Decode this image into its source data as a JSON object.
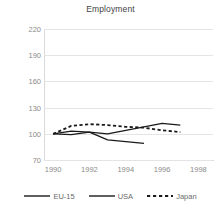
{
  "chart_data": {
    "type": "line",
    "title": "Employment",
    "xlabel": "",
    "ylabel": "",
    "x": [
      1990,
      1991,
      1992,
      1993,
      1994,
      1995,
      1996,
      1997
    ],
    "xlim": [
      1989.5,
      1998.8
    ],
    "ylim": [
      70,
      220
    ],
    "yticks": [
      70,
      100,
      130,
      160,
      190,
      220
    ],
    "xticks": [
      1990,
      1992,
      1994,
      1996,
      1998
    ],
    "grid": true,
    "legend_position": "bottom",
    "series": [
      {
        "name": "EU-15",
        "style": "solid",
        "color": "#1a1a1a",
        "x": [
          1990,
          1991,
          1992,
          1993,
          1994,
          1995
        ],
        "values": [
          100,
          99,
          102,
          93,
          91,
          89
        ]
      },
      {
        "name": "USA",
        "style": "solid",
        "color": "#1a1a1a",
        "x": [
          1990,
          1991,
          1992,
          1993,
          1994,
          1995,
          1996,
          1997
        ],
        "values": [
          100,
          103,
          102,
          100,
          104,
          108,
          112,
          110
        ]
      },
      {
        "name": "Japan",
        "style": "dotted",
        "color": "#1a1a1a",
        "x": [
          1990,
          1991,
          1992,
          1993,
          1994,
          1995,
          1996,
          1997
        ],
        "values": [
          100,
          109,
          111,
          110,
          108,
          107,
          104,
          102
        ]
      }
    ]
  },
  "title": "Employment",
  "axes": {
    "y_ticks": [
      "220",
      "190",
      "160",
      "130",
      "100",
      "70"
    ],
    "x_ticks": [
      "1990",
      "1992",
      "1994",
      "1996",
      "1998"
    ]
  },
  "legend": {
    "items": [
      {
        "label": "EU-15",
        "style": "solid"
      },
      {
        "label": "USA",
        "style": "solid"
      },
      {
        "label": "Japan",
        "style": "dotted"
      }
    ]
  },
  "colors": {
    "line": "#1a1a1a",
    "grid": "#e4e4e4",
    "tick_text": "#8a8a8a",
    "title_text": "#3f3f3f"
  }
}
